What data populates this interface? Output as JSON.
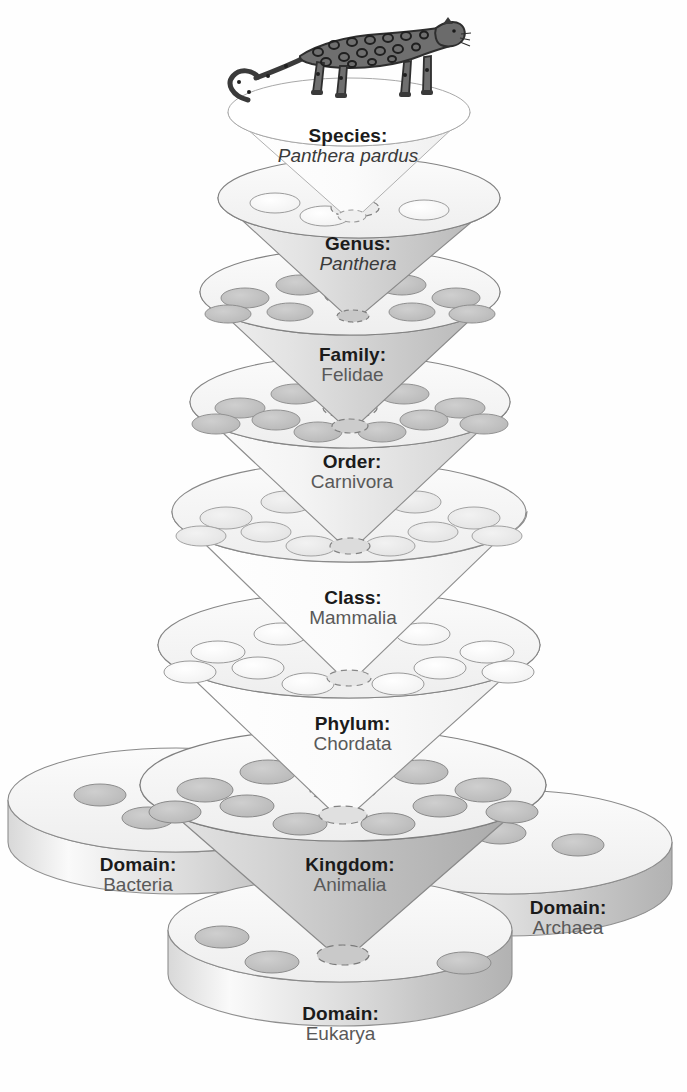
{
  "diagram": {
    "organism_illustration": "leopard-illustration",
    "background_color": "#ffffff",
    "rank_label_color": "#1b1b1b",
    "taxon_label_color": "#595959"
  },
  "levels": [
    {
      "id": "species",
      "rank": "Species:",
      "taxon": "Panthera pardus",
      "italic": true,
      "holes": 0,
      "shape": "funnel"
    },
    {
      "id": "genus",
      "rank": "Genus:",
      "taxon": "Panthera",
      "italic": true,
      "holes": 3,
      "shape": "funnel"
    },
    {
      "id": "family",
      "rank": "Family:",
      "taxon": "Felidae",
      "italic": false,
      "holes": 8,
      "shape": "funnel"
    },
    {
      "id": "order",
      "rank": "Order:",
      "taxon": "Carnivora",
      "italic": false,
      "holes": 10,
      "shape": "funnel"
    },
    {
      "id": "class",
      "rank": "Class:",
      "taxon": "Mammalia",
      "italic": false,
      "holes": 11,
      "shape": "funnel"
    },
    {
      "id": "phylum",
      "rank": "Phylum:",
      "taxon": "Chordata",
      "italic": false,
      "holes": 12,
      "shape": "funnel"
    },
    {
      "id": "kingdom",
      "rank": "Kingdom:",
      "taxon": "Animalia",
      "italic": false,
      "holes": 12,
      "shape": "funnel"
    }
  ],
  "domains": [
    {
      "id": "bacteria",
      "rank": "Domain:",
      "taxon": "Bacteria",
      "holes": 4,
      "shape": "half-disc",
      "position": "left"
    },
    {
      "id": "archaea",
      "rank": "Domain:",
      "taxon": "Archaea",
      "holes": 4,
      "shape": "half-disc",
      "position": "right"
    },
    {
      "id": "eukarya",
      "rank": "Domain:",
      "taxon": "Eukarya",
      "holes": 3,
      "shape": "half-disc",
      "position": "front"
    }
  ]
}
